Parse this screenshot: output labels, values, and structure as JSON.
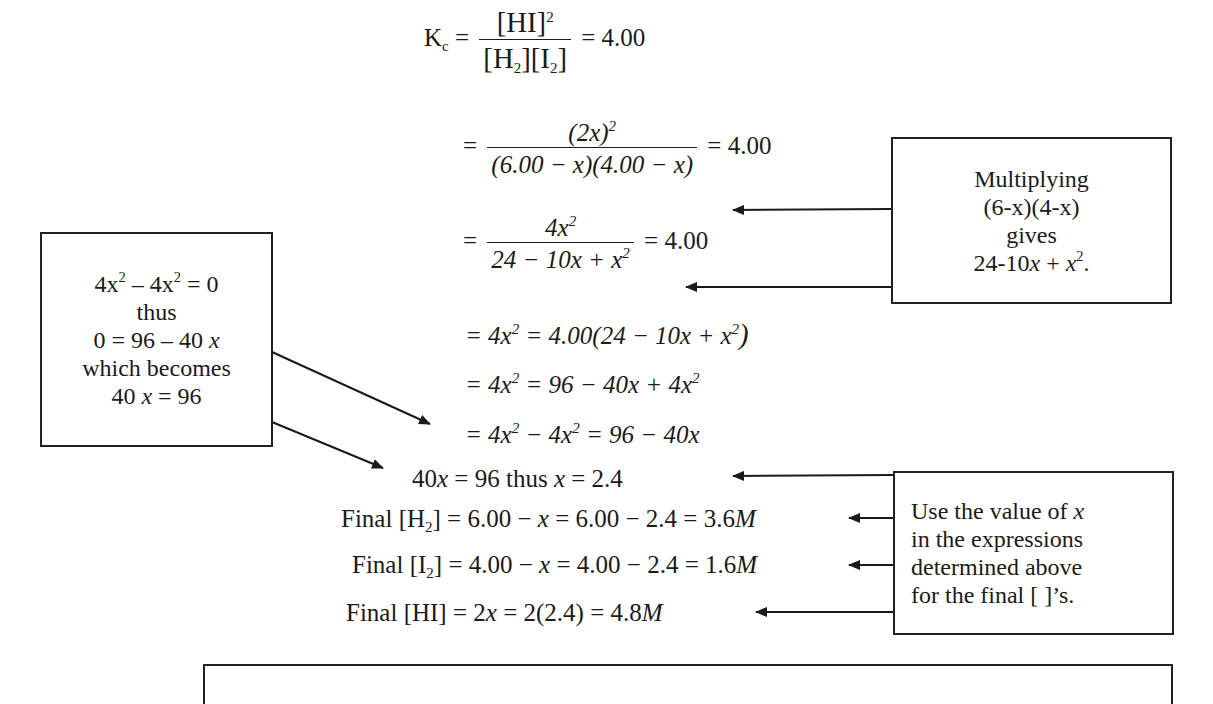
{
  "equations": {
    "kc": {
      "lhs": "K",
      "lhs_sub": "c",
      "num": "[HI]",
      "num_sup": "2",
      "den_a": "[H",
      "den_a_sub": "2",
      "den_a_close": "]",
      "den_b": "[I",
      "den_b_sub": "2",
      "den_b_close": "]",
      "rhs": "= 4.00"
    },
    "step1": {
      "eq": "=",
      "num": "(2x)",
      "num_sup": "2",
      "den": "(6.00 − x)(4.00 − x)",
      "rhs": "= 4.00"
    },
    "step2": {
      "eq": "=",
      "num": "4x",
      "num_sup": "2",
      "den_a": "24 − 10x + x",
      "den_sup": "2",
      "rhs": "= 4.00"
    },
    "step3": {
      "a": "= 4x",
      "a_sup": "2",
      "b": " = 4.00(24 − 10x + x",
      "b_sup": "2",
      "c": ")"
    },
    "step4": {
      "a": "= 4x",
      "a_sup": "2",
      "b": " = 96 − 40x + 4x",
      "b_sup": "2"
    },
    "step5": {
      "a": "= 4x",
      "a_sup": "2",
      "b": " − 4x",
      "b_sup": "2",
      "c": " = 96 − 40x"
    },
    "step6": {
      "text_a": "40",
      "var_a": "x",
      "text_b": " = 96 thus ",
      "var_b": "x",
      "text_c": " = 2.4"
    },
    "final_h2": {
      "label": "Final [H",
      "sub": "2",
      "close": "]",
      "expr": " = 6.00 − ",
      "var": "x",
      "rest": " = 6.00 − 2.4 = 3.6",
      "unit": "M"
    },
    "final_i2": {
      "label": "Final [I",
      "sub": "2",
      "close": "]",
      "expr": " = 4.00 − ",
      "var": "x",
      "rest": " = 4.00 − 2.4 = 1.6",
      "unit": "M"
    },
    "final_hi": {
      "label": "Final [HI]",
      "expr": " = 2",
      "var": "x",
      "rest": " = 2(2.4) = 4.8",
      "unit": "M"
    }
  },
  "notes": {
    "multiplying": {
      "line1": "Multiplying",
      "line2": "(6-x)(4-x)",
      "line3": "gives",
      "line4_a": "24-10",
      "line4_x": "x",
      "line4_b": " + ",
      "line4_x2": "x",
      "line4_sup": "2",
      "line4_end": "."
    },
    "cancel": {
      "line1_a": "4x",
      "line1_sup1": "2",
      "line1_b": " – 4x",
      "line1_sup2": "2",
      "line1_c": " = 0",
      "line2": "thus",
      "line3_a": "0 = 96 – 40 ",
      "line3_x": "x",
      "line4": "which becomes",
      "line5_a": "40 ",
      "line5_x": "x",
      "line5_b": " = 96"
    },
    "use_value": {
      "line1_a": "Use the value of ",
      "line1_x": "x",
      "line2": "in the expressions",
      "line3": "determined above",
      "line4": "for the final [ ]’s."
    }
  },
  "colors": {
    "ink": "#1a1a1a",
    "border": "#222222",
    "background": "#ffffff"
  }
}
